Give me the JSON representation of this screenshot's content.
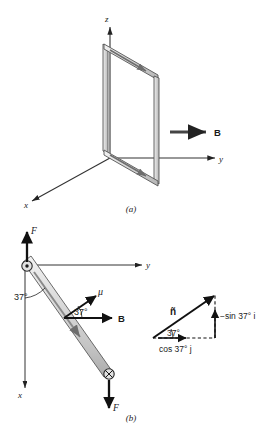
{
  "figure": {
    "title_caption_a": "(a)",
    "title_caption_b": "(b)",
    "panel_a": {
      "axes": {
        "z_label": "z",
        "y_label": "y",
        "x_label": "x"
      },
      "field_label": "B",
      "loop_name": "current-loop",
      "colors": {
        "axis": "#333333",
        "loop_fill": "#d6d6d6",
        "loop_stroke": "#555555",
        "arrow": "#222222"
      }
    },
    "panel_b": {
      "axes": {
        "y_label": "y",
        "x_label": "x"
      },
      "force_top_label": "F",
      "force_bottom_label": "F",
      "moment_label": "μ",
      "field_label": "B",
      "angle_pivot": "37°",
      "angle_moment": "37°",
      "pivot_out_of_page": "⊙",
      "pivot_into_page": "⊗",
      "colors": {
        "rod_fill": "#d4d4d4",
        "rod_stroke": "#5a5a5a",
        "axis": "#333333"
      }
    },
    "panel_b_triangle": {
      "unit_normal_label": "ñ",
      "vertical_component_label": "−sin 37° i",
      "horizontal_component_label": "cos 37° j",
      "angle_label": "37°",
      "colors": {
        "vector": "#111111",
        "dashed": "#111111"
      }
    }
  }
}
